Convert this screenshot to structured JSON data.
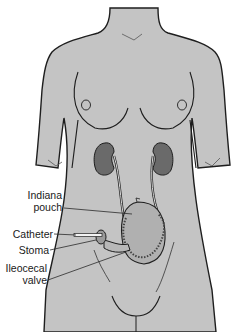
{
  "diagram": {
    "colors": {
      "skin": "#c4c4c4",
      "skin_shadow": "#a9a9a9",
      "outline": "#1e1e1e",
      "kidney": "#6a6a6a",
      "pouch": "#b0b0b0",
      "leader_line": "#2a2a2a"
    },
    "labels": [
      {
        "id": "indiana-pouch",
        "line1": "Indiana",
        "line2": "pouch"
      },
      {
        "id": "catheter",
        "line1": "Catheter"
      },
      {
        "id": "stoma",
        "line1": "Stoma"
      },
      {
        "id": "ileocecal-valve",
        "line1": "Ileocecal",
        "line2": "valve"
      }
    ]
  }
}
